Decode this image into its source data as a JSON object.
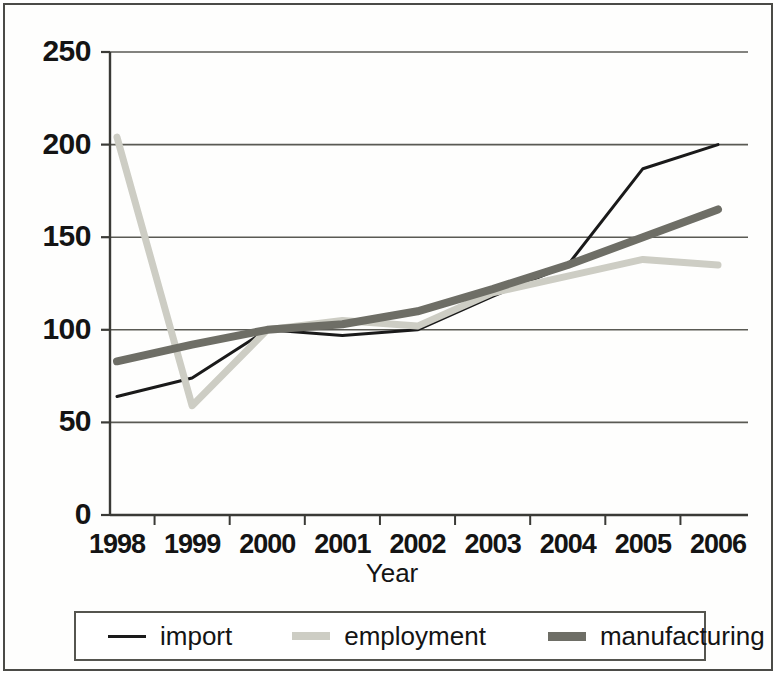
{
  "chart_data": {
    "type": "line",
    "title": "",
    "xlabel": "Year",
    "ylabel": "",
    "categories": [
      "1998",
      "1999",
      "2000",
      "2001",
      "2002",
      "2003",
      "2004",
      "2005",
      "2006"
    ],
    "ylim": [
      0,
      250
    ],
    "yticks": [
      0,
      50,
      100,
      150,
      200,
      250
    ],
    "ytick_labels": [
      "0",
      "50",
      "100",
      "150",
      "200",
      "250"
    ],
    "grid": "horizontal",
    "legend_position": "bottom",
    "series": [
      {
        "name": "import",
        "color": "#1a1a1a",
        "width": 3,
        "values": [
          64,
          74,
          100,
          97,
          100,
          118,
          135,
          187,
          200
        ]
      },
      {
        "name": "employment",
        "color": "#cdcdc4",
        "width": 7,
        "values": [
          204,
          59,
          100,
          105,
          102,
          120,
          129,
          138,
          135
        ]
      },
      {
        "name": "manufacturing",
        "color": "#6e6e66",
        "width": 8,
        "values": [
          83,
          92,
          100,
          103,
          110,
          122,
          135,
          150,
          165
        ]
      }
    ]
  },
  "axis": {
    "x_title": "Year",
    "y_tick_labels": [
      "250",
      "200",
      "150",
      "100",
      "50",
      "0"
    ],
    "x_tick_labels": [
      "1998",
      "1999",
      "2000",
      "2001",
      "2002",
      "2003",
      "2004",
      "2005",
      "2006"
    ]
  },
  "legend": {
    "items": [
      {
        "label": "import",
        "color": "#1a1a1a",
        "thickness": "3px"
      },
      {
        "label": "employment",
        "color": "#cdcdc4",
        "thickness": "8px"
      },
      {
        "label": "manufacturing",
        "color": "#6e6e66",
        "thickness": "9px"
      }
    ]
  },
  "colors": {
    "import": "#1a1a1a",
    "employment": "#cdcdc4",
    "manufacturing": "#6e6e66",
    "axis": "#3a3a36",
    "grid": "#5a5a54",
    "frame": "#4b4b47",
    "background": "#fefefd",
    "text": "#141414"
  }
}
